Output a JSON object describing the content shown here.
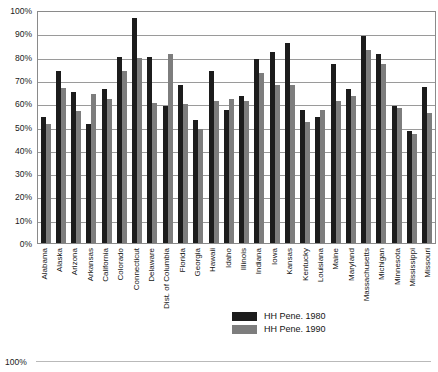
{
  "chart_data": {
    "type": "bar",
    "title": "",
    "xlabel": "",
    "ylabel": "",
    "ylim": [
      0,
      100
    ],
    "ytick_labels": [
      "100%",
      "90%",
      "80%",
      "70%",
      "60%",
      "50%",
      "40%",
      "30%",
      "20%",
      "10%",
      "0%"
    ],
    "ytick_values": [
      100,
      90,
      80,
      70,
      60,
      50,
      40,
      30,
      20,
      10,
      0
    ],
    "grid": true,
    "legend_position": "bottom-center",
    "categories": [
      "Alabama",
      "Alaska",
      "Arizona",
      "Arkansas",
      "California",
      "Colorado",
      "Connecticut",
      "Delaware",
      "Dist. of Columbia",
      "Florida",
      "Georgia",
      "Hawaii",
      "Idaho",
      "Illinois",
      "Indiana",
      "Iowa",
      "Kansas",
      "Kentucky",
      "Louisiana",
      "Maine",
      "Maryland",
      "Massachusetts",
      "Michigan",
      "Minnesota",
      "Mississippi",
      "Missouri"
    ],
    "series": [
      {
        "name": "HH Pene. 1980",
        "color": "#1c1c1c",
        "values": [
          54,
          74,
          65,
          51,
          66,
          80,
          96.5,
          80,
          59,
          68,
          53,
          74,
          57,
          63,
          79,
          82,
          86,
          57,
          54,
          77,
          66,
          89,
          81,
          59,
          48,
          67
        ]
      },
      {
        "name": "HH Pene. 1990",
        "color": "#7d7d7d",
        "values": [
          51,
          66.5,
          56.5,
          64,
          62,
          74,
          79.5,
          60,
          81,
          59.5,
          49,
          61,
          62,
          61,
          73,
          68,
          68,
          52,
          57,
          61,
          63,
          83,
          77,
          58,
          47,
          56
        ]
      }
    ]
  },
  "legend": {
    "items": [
      {
        "label": "HH Pene. 1980"
      },
      {
        "label": "HH Pene. 1990"
      }
    ]
  },
  "next_chart_peek": {
    "tick_label": "100%"
  }
}
